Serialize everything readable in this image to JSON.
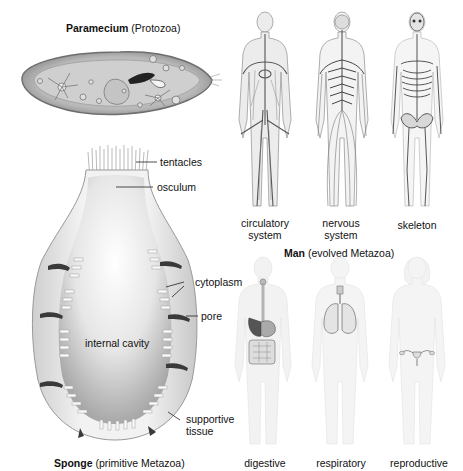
{
  "paramecium": {
    "title_bold": "Paramecium",
    "title_rest": " (Protozoa)"
  },
  "sponge": {
    "title_bold": "Sponge",
    "title_rest": " (primitive Metazoa)",
    "labels": {
      "tentacles": "tentacles",
      "osculum": "osculum",
      "cytoplasm": "cytoplasm",
      "pore": "pore",
      "internal_cavity": "internal cavity",
      "supportive_tissue_1": "supportive",
      "supportive_tissue_2": "tissue"
    }
  },
  "man": {
    "title_bold": "Man",
    "title_rest": " (evolved Metazoa)",
    "top_row": [
      {
        "line1": "circulatory",
        "line2": "system"
      },
      {
        "line1": "nervous",
        "line2": "system"
      },
      {
        "line1": "skeleton",
        "line2": ""
      }
    ],
    "bottom_row": [
      {
        "line1": "digestive"
      },
      {
        "line1": "respiratory"
      },
      {
        "line1": "reproductive"
      }
    ]
  },
  "colors": {
    "ink": "#111111",
    "body_gray": "#8a8a8a",
    "faint_body": "#ececec",
    "sponge_shell": "#e6e6e6"
  }
}
